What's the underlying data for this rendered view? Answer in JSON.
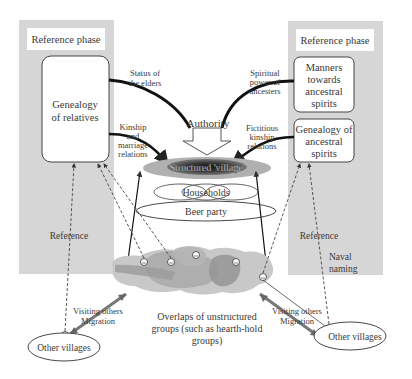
{
  "left_panel": {
    "phase_label": "Reference phase",
    "box_line1": "Genealogy",
    "box_line2": "of relatives"
  },
  "right_panel": {
    "phase_label": "Reference phase",
    "box1": [
      "Manners",
      "towards",
      "ancestral",
      "spirits"
    ],
    "box2": [
      "Genealogy of",
      "ancestral",
      "spirits"
    ]
  },
  "edge_labels": {
    "status_elders": [
      "Status of",
      "the elders"
    ],
    "kinship_marriage": [
      "Kinship",
      "and",
      "marriage",
      "relations"
    ],
    "spiritual_power": [
      "Spiritual",
      "power of",
      "ancesters"
    ],
    "fictitious_kinship": [
      "Fictitious",
      "kinship",
      "relations"
    ]
  },
  "center": {
    "authority": "Authority",
    "structured_village": "Structured 'village'",
    "households": "Households",
    "beer_party": "Beer party",
    "overlaps": [
      "Overlaps of unstructured",
      "groups (such as hearth-hold",
      "groups)"
    ]
  },
  "bottom": {
    "reference_left": "Reference",
    "reference_right": "Reference",
    "naval_naming": [
      "Naval",
      "naming"
    ],
    "visiting_left": [
      "Visiting others",
      "Migration"
    ],
    "visiting_right": [
      "Visiting others",
      "Migration"
    ],
    "other_villages_left": "Other villages",
    "other_villages_right": "Other villages"
  },
  "colors": {
    "panel_gray": "#d6d6d6",
    "blob_light": "#c4c4c4",
    "blob_mid": "#a9a9a9",
    "blob_dark": "#8f8f8f",
    "village_outer": "#b0b0b0",
    "village_inner": "#2a2a2a"
  }
}
